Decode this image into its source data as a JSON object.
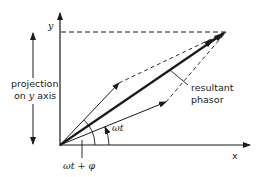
{
  "diagram": {
    "type": "phasor-addition",
    "axes": {
      "y_label": "y",
      "x_label": "x"
    },
    "labels": {
      "projection_line1": "projection",
      "projection_line2_prefix": "on ",
      "projection_line2_var": "y",
      "projection_line2_suffix": " axis",
      "resultant_line1": "resultant",
      "resultant_line2": "phasor",
      "angle_small": "ωt",
      "angle_large": "ωt + φ"
    },
    "geometry": {
      "origin": [
        60,
        145
      ],
      "y_axis_top": [
        60,
        12
      ],
      "x_axis_end": [
        250,
        145
      ],
      "resultant_tip": [
        226,
        32
      ],
      "phasor_a_tip": [
        119,
        83
      ],
      "phasor_b_tip": [
        166,
        102
      ]
    },
    "colors": {
      "ink": "#1a1a1a",
      "background": "#ffffff"
    }
  }
}
